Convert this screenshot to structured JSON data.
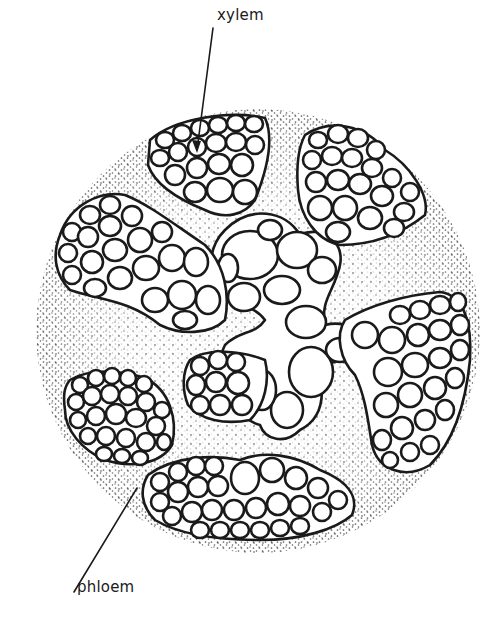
{
  "diagram": {
    "labels": {
      "xylem": "xylem",
      "phloem": "phloem"
    },
    "colors": {
      "line": "#1a1a1a",
      "background": "#ffffff",
      "stipple": "#2a2a2a"
    },
    "stele_circle": {
      "cx": 258,
      "cy": 331,
      "r": 222
    },
    "xylem_arms": 5,
    "phloem_groups": 5
  }
}
